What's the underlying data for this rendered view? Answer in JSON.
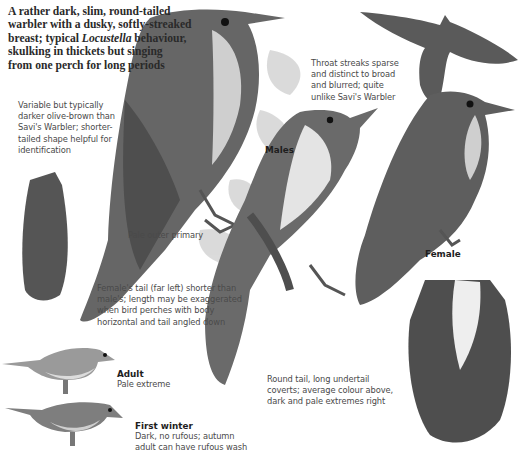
{
  "intro": {
    "line1": "A rather dark, slim, round-tailed",
    "line2": "warbler with a dusky, softly-streaked",
    "line3_pre": "breast; typical ",
    "line3_em": "Locustella",
    "line3_post": " behaviour,",
    "line4": "skulking in thickets but singing",
    "line5": "from one perch for long periods"
  },
  "notes": {
    "plumage": [
      "Variable but typically",
      "darker olive-brown than",
      "Savi's Warbler; shorter-",
      "tailed shape helpful for",
      "identification"
    ],
    "throat": [
      "Throat streaks sparse",
      "and distinct to broad",
      "and blurred; quite",
      "unlike Savi's Warbler"
    ],
    "primary": "Pale outer primary",
    "tail": [
      "Female's tail (far left) shorter than",
      "male's; length may be exaggerated",
      "when bird perches with body",
      "horizontal and tail angled down"
    ],
    "undertail": [
      "Round tail, long undertail",
      "coverts; average colour above,",
      "dark and pale extremes right"
    ]
  },
  "labels": {
    "males": "Males",
    "female": "Female",
    "adult": {
      "title": "Adult",
      "desc": "Pale extreme"
    },
    "first_winter": {
      "title": "First winter",
      "desc1": "Dark, no rufous; autumn",
      "desc2": "adult can have rufous wash"
    }
  },
  "colors": {
    "bird_dark": "#4a4a4a",
    "bird_mid": "#6e6e6e",
    "bird_light": "#9a9a9a",
    "throat_pale": "#d8d8d8",
    "leaf": "#c9c9c9"
  }
}
